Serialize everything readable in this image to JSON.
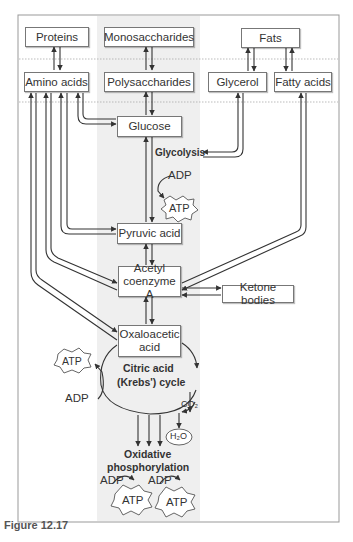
{
  "figure": {
    "caption": "Figure 12.17",
    "colors": {
      "shade": "#efefef",
      "line": "#333333",
      "box_border": "#777777",
      "text": "#333333"
    }
  },
  "nodes": {
    "proteins": "Proteins",
    "monosaccharides": "Monosaccharides",
    "fats": "Fats",
    "amino_acids": "Amino acids",
    "polysaccharides": "Polysaccharides",
    "glycerol": "Glycerol",
    "fatty_acids": "Fatty acids",
    "glucose": "Glucose",
    "pyruvic_acid": "Pyruvic acid",
    "acetyl_coa_line1": "Acetyl",
    "acetyl_coa_line2": "coenzyme A",
    "ketone_bodies": "Ketone bodies",
    "oxaloacetic_line1": "Oxaloacetic",
    "oxaloacetic_line2": "acid"
  },
  "labels": {
    "glycolysis": "Glycolysis",
    "adp_glycolysis": "ADP",
    "atp_glycolysis": "ATP",
    "krebs_line1": "Citric acid",
    "krebs_line2": "(Krebs') cycle",
    "atp_krebs": "ATP",
    "adp_krebs": "ADP",
    "co2": "CO₂",
    "h2o": "H₂O",
    "oxphos_line1": "Oxidative",
    "oxphos_line2": "phosphorylation",
    "adp_ox1": "ADP",
    "adp_ox2": "ADP",
    "atp_ox1": "ATP",
    "atp_ox2": "ATP"
  }
}
